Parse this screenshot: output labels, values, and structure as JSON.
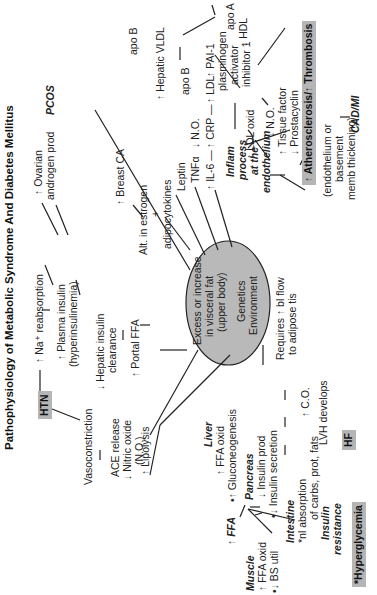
{
  "title": "Pathophysiology of Metabolic Syndrome And Diabetes Mellitus",
  "center": {
    "line1": "Excess or increase",
    "line2": "in visceral fat",
    "line3": "(upper body)",
    "line4": "Genetics",
    "line5": "Environment",
    "fill": "#b9b9b9"
  },
  "nodes": {
    "htn": "HTN",
    "na_reabsorption": "↑ Na⁺ reabsorption",
    "plasma_insulin_1": "↑ Plasma insulin",
    "plasma_insulin_2": "(hyperinsulinemia)",
    "ovarian_1": "↑ Ovarian",
    "ovarian_2": "androgen prod",
    "pcos": "PCOS",
    "vasoconstriction": "Vasoconstriction",
    "hepatic_insulin_1": "↓ Hepatic insulin",
    "hepatic_insulin_2": "clearance",
    "breast_ca": "↑ Breast CA",
    "ace_1": "ACE release",
    "ace_2": "↓ Nitric oxide",
    "ace_3": "(N.O.)",
    "portal_ffa": "↑ Portal FFA",
    "estrogen_1": "Alt. in estrogen",
    "estrogen_2": "+",
    "estrogen_3": "adipocytokines",
    "leptin": "Leptin",
    "tnf": "TNFα",
    "il6": "↑ IL-6 —",
    "no_down": "↓ N.O.",
    "crp": "↑ CRP —",
    "ldl": "↑ LDL",
    "apo_b_ldl": "apo B",
    "apo_b_vldl": "apo B",
    "hepatic_vldl": "↑ Hepatic VLDL",
    "apo_a": "apo A",
    "hdl": "↓ HDL",
    "pai_1": "↑ PAI-1",
    "pai_2": "plasminogen",
    "pai_3": "activator",
    "pai_4": "inhibitor 1",
    "inflam_1": "Inflam",
    "inflam_2": "process",
    "inflam_3": "at the",
    "inflam_4": "endothelium",
    "ldl_oxid": "↑ LDL oxid",
    "endo_1": "↓ N.O.",
    "endo_2": "↑ Tissue factor",
    "endo_3": "↓ Prostacyclin",
    "athero": "↑ Atherosclerosis/↑ Thrombosis",
    "athero_note_1": "(endothelium or",
    "athero_note_2": "basement",
    "athero_note_3": "memb thickening)",
    "cad_mi": "CAD/MI",
    "lipolysis": "↑ Lipolysis",
    "ffa": "↑ FFA",
    "liver": "Liver",
    "liver_1": "↑ FFA oxid",
    "liver_2": "•↑ Gluconeogenesis",
    "pancreas": "Pancreas",
    "pancreas_1": "↓ Insulin prod",
    "pancreas_2": "•↓ Insulin secretion",
    "muscle": "Muscle",
    "muscle_1": "↑ FFA oxid",
    "muscle_2": "•↓ BS util",
    "intestine": "Intestine",
    "intestine_1": "*nl absorption",
    "intestine_2": "of carbs, prot, fats",
    "insulin_res_1": "Insulin",
    "insulin_res_2": "resistance",
    "hyperglycemia": "*Hyperglycemia",
    "bl_flow_1": "Requires ↑ bl flow",
    "bl_flow_2": "to adipose tis",
    "co": "↑ C.O.",
    "lvh": "LVH develops",
    "hf": "HF"
  },
  "colors": {
    "highlight_box": "#b5b5b5",
    "ellipse": "#b9b9b9",
    "line": "#222222"
  }
}
